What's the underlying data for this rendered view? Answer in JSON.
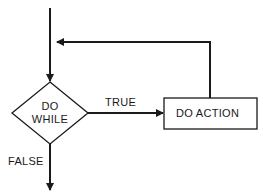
{
  "diagram": {
    "type": "flowchart",
    "colors": {
      "stroke": "#1a1a1a",
      "background": "#ffffff"
    },
    "nodes": {
      "decision": {
        "shape": "diamond",
        "line1": "DO",
        "line2": "WHILE"
      },
      "action": {
        "shape": "rectangle",
        "label": "DO ACTION"
      }
    },
    "edges": {
      "entry": {
        "from": "start",
        "to": "decision",
        "label": ""
      },
      "true": {
        "from": "decision",
        "to": "action",
        "label": "TRUE"
      },
      "loop": {
        "from": "action",
        "to": "entry",
        "label": ""
      },
      "false": {
        "from": "decision",
        "to": "exit",
        "label": "FALSE"
      }
    }
  }
}
